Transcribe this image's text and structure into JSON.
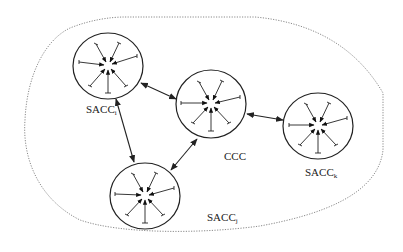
{
  "diagram": {
    "type": "network-architecture",
    "boundary": {
      "style": "dotted",
      "color": "#888888"
    },
    "colors": {
      "stroke": "#222222",
      "boundary": "#8a8a8a",
      "background": "#ffffff"
    },
    "nodes": [
      {
        "id": "sacc_i",
        "label_base": "SACC",
        "label_sub": "i",
        "cx": 108,
        "cy": 66,
        "rx": 35,
        "ry": 33
      },
      {
        "id": "ccc",
        "label_base": "CCC",
        "label_sub": "",
        "cx": 211,
        "cy": 104,
        "rx": 35,
        "ry": 34
      },
      {
        "id": "sacc_k",
        "label_base": "SACC",
        "label_sub": "k",
        "cx": 318,
        "cy": 126,
        "rx": 35,
        "ry": 33
      },
      {
        "id": "sacc_j",
        "label_base": "SACC",
        "label_sub": "j",
        "cx": 145,
        "cy": 196,
        "rx": 35,
        "ry": 33
      }
    ],
    "edges": [
      {
        "from": "sacc_i",
        "to": "ccc",
        "direction": "bidirectional"
      },
      {
        "from": "sacc_i",
        "to": "sacc_j",
        "direction": "bidirectional"
      },
      {
        "from": "ccc",
        "to": "sacc_j",
        "direction": "bidirectional"
      },
      {
        "from": "ccc",
        "to": "sacc_k",
        "direction": "bidirectional"
      }
    ],
    "labels": {
      "sacc_i": {
        "base": "SACC",
        "sub": "i"
      },
      "ccc": {
        "base": "CCC",
        "sub": ""
      },
      "sacc_k": {
        "base": "SACC",
        "sub": "k"
      },
      "sacc_j": {
        "base": "SACC",
        "sub": "j"
      }
    }
  }
}
